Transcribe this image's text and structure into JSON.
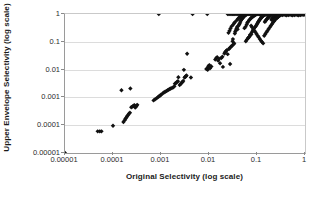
{
  "chart_data": {
    "type": "scatter",
    "title": "",
    "xlabel": "Original Selectivity (log scale)",
    "ylabel": "Upper Envelope Selectivity (log scale)",
    "xscale": "log",
    "yscale": "log",
    "xlim": [
      1e-05,
      1
    ],
    "ylim": [
      1e-05,
      1
    ],
    "xticks": [
      "0.00001",
      "0.0001",
      "0.001",
      "0.01",
      "0.1",
      "1"
    ],
    "yticks": [
      "1",
      "0.1",
      "0.01",
      "0.001",
      "0.0001",
      "0.00001"
    ],
    "xtick_values": [
      1e-05,
      0.0001,
      0.001,
      0.01,
      0.1,
      1
    ],
    "ytick_values": [
      1,
      0.1,
      0.01,
      0.001,
      0.0001,
      1e-05
    ],
    "grid": "horizontal",
    "legend": "none",
    "marker": "filled-diamond",
    "marker_color": "#111111",
    "marker_size": 2.2,
    "points": [
      [
        1e-05,
        1e-05
      ],
      [
        4.8e-05,
        6e-05
      ],
      [
        5.3e-05,
        6e-05
      ],
      [
        5.75e-05,
        6e-05
      ],
      [
        0.0001,
        9.5e-05
      ],
      [
        0.00015,
        0.0018
      ],
      [
        0.00023,
        0.0021
      ],
      [
        0.000165,
        0.00013
      ],
      [
        0.000175,
        0.00015
      ],
      [
        0.000182,
        0.00017
      ],
      [
        0.00019,
        0.00019
      ],
      [
        0.000196,
        0.00021
      ],
      [
        0.000205,
        0.00023
      ],
      [
        0.000215,
        0.00026
      ],
      [
        0.000225,
        0.00028
      ],
      [
        0.00024,
        0.00044
      ],
      [
        0.000255,
        0.00047
      ],
      [
        0.000268,
        0.0005
      ],
      [
        0.00028,
        0.00052
      ],
      [
        0.00029,
        0.00043
      ],
      [
        0.0003,
        0.00046
      ],
      [
        0.00031,
        0.0005
      ],
      [
        0.00032,
        0.00054
      ],
      [
        0.0007,
        0.00078
      ],
      [
        0.00075,
        0.00085
      ],
      [
        0.0008,
        0.00092
      ],
      [
        0.00085,
        0.001
      ],
      [
        0.0009,
        0.00108
      ],
      [
        0.00095,
        0.00115
      ],
      [
        0.001,
        0.00125
      ],
      [
        0.00108,
        0.00138
      ],
      [
        0.00115,
        0.0015
      ],
      [
        0.00122,
        0.0016
      ],
      [
        0.0013,
        0.0017
      ],
      [
        0.00138,
        0.0018
      ],
      [
        0.00145,
        0.0019
      ],
      [
        0.00152,
        0.002
      ],
      [
        0.0016,
        0.0021
      ],
      [
        0.0017,
        0.0022
      ],
      [
        0.0018,
        0.0023
      ],
      [
        0.0019,
        0.0025
      ],
      [
        0.00195,
        0.0031
      ],
      [
        0.00205,
        0.0033
      ],
      [
        0.00215,
        0.0036
      ],
      [
        0.00225,
        0.0038
      ],
      [
        0.0023,
        0.0053
      ],
      [
        0.00245,
        0.0028
      ],
      [
        0.0026,
        0.0031
      ],
      [
        0.0027,
        0.0034
      ],
      [
        0.0028,
        0.0036
      ],
      [
        0.0029,
        0.0039
      ],
      [
        0.003,
        0.0098
      ],
      [
        0.0031,
        0.0052
      ],
      [
        0.0032,
        0.0055
      ],
      [
        0.0033,
        0.0058
      ],
      [
        0.0034,
        0.0061
      ],
      [
        0.0035,
        0.037
      ],
      [
        0.0042,
        0.0052
      ],
      [
        0.00455,
        1
      ],
      [
        0.0009,
        1
      ],
      [
        0.0088,
        0.0105
      ],
      [
        0.0092,
        0.011
      ],
      [
        0.0094,
        0.0098
      ],
      [
        0.0096,
        0.0125
      ],
      [
        0.0098,
        0.0135
      ],
      [
        0.0102,
        0.0145
      ],
      [
        0.0105,
        0.0112
      ],
      [
        0.0112,
        0.013
      ],
      [
        0.0092,
        1
      ],
      [
        0.0135,
        0.023
      ],
      [
        0.0142,
        0.026
      ],
      [
        0.0148,
        0.028
      ],
      [
        0.0155,
        0.021
      ],
      [
        0.0162,
        0.0245
      ],
      [
        0.017,
        0.017
      ],
      [
        0.018,
        0.026
      ],
      [
        0.019,
        0.029
      ],
      [
        0.0195,
        0.0125
      ],
      [
        0.021,
        0.038
      ],
      [
        0.0215,
        0.042
      ],
      [
        0.0225,
        0.046
      ],
      [
        0.0235,
        0.05
      ],
      [
        0.0245,
        0.036
      ],
      [
        0.026,
        0.055
      ],
      [
        0.027,
        0.06
      ],
      [
        0.0275,
        0.016
      ],
      [
        0.029,
        0.068
      ],
      [
        0.0302,
        0.072
      ],
      [
        0.031,
        0.105
      ],
      [
        0.0315,
        0.125
      ],
      [
        0.0325,
        0.082
      ],
      [
        0.0335,
        0.088
      ],
      [
        0.0345,
        0.2
      ],
      [
        0.0352,
        0.23
      ],
      [
        0.0362,
        0.26
      ],
      [
        0.0375,
        0.3
      ],
      [
        0.0385,
        0.34
      ],
      [
        0.0395,
        0.28
      ],
      [
        0.041,
        0.38
      ],
      [
        0.0425,
        0.42
      ],
      [
        0.0435,
        0.46
      ],
      [
        0.0448,
        0.52
      ],
      [
        0.0462,
        0.58
      ],
      [
        0.0475,
        0.63
      ],
      [
        0.049,
        0.68
      ],
      [
        0.0505,
        0.72
      ],
      [
        0.052,
        0.77
      ],
      [
        0.0535,
        0.82
      ],
      [
        0.0548,
        0.31
      ],
      [
        0.0562,
        0.88
      ],
      [
        0.0578,
        0.35
      ],
      [
        0.0595,
        0.93
      ],
      [
        0.061,
        0.42
      ],
      [
        0.0628,
        0.48
      ],
      [
        0.0645,
        0.52
      ],
      [
        0.0662,
        0.14
      ],
      [
        0.068,
        0.58
      ],
      [
        0.07,
        0.63
      ],
      [
        0.0718,
        0.18
      ],
      [
        0.0738,
        0.68
      ],
      [
        0.0758,
        0.73
      ],
      [
        0.0778,
        0.22
      ],
      [
        0.08,
        0.78
      ],
      [
        0.082,
        0.26
      ],
      [
        0.0842,
        0.83
      ],
      [
        0.0865,
        0.3
      ],
      [
        0.089,
        0.88
      ],
      [
        0.0912,
        0.34
      ],
      [
        0.0938,
        0.93
      ],
      [
        0.0962,
        0.38
      ],
      [
        0.099,
        0.42
      ],
      [
        0.102,
        0.46
      ],
      [
        0.1045,
        0.5
      ],
      [
        0.1075,
        0.54
      ],
      [
        0.1105,
        0.58
      ],
      [
        0.1135,
        0.62
      ],
      [
        0.1165,
        0.66
      ],
      [
        0.12,
        0.7
      ],
      [
        0.123,
        0.74
      ],
      [
        0.1265,
        0.78
      ],
      [
        0.13,
        0.82
      ],
      [
        0.134,
        0.86
      ],
      [
        0.1375,
        0.9
      ],
      [
        0.1415,
        0.94
      ],
      [
        0.1455,
        0.52
      ],
      [
        0.15,
        0.56
      ],
      [
        0.154,
        0.6
      ],
      [
        0.1585,
        0.64
      ],
      [
        0.163,
        0.68
      ],
      [
        0.168,
        0.72
      ],
      [
        0.1725,
        0.76
      ],
      [
        0.178,
        0.8
      ],
      [
        0.183,
        0.84
      ],
      [
        0.188,
        0.88
      ],
      [
        0.194,
        0.92
      ],
      [
        0.2,
        0.62
      ],
      [
        0.205,
        0.66
      ],
      [
        0.212,
        0.7
      ],
      [
        0.218,
        0.74
      ],
      [
        0.224,
        0.78
      ],
      [
        0.231,
        0.82
      ],
      [
        0.238,
        0.86
      ],
      [
        0.245,
        0.9
      ],
      [
        0.252,
        0.94
      ],
      [
        0.26,
        0.72
      ],
      [
        0.268,
        0.76
      ],
      [
        0.276,
        0.8
      ],
      [
        0.284,
        0.84
      ],
      [
        0.293,
        0.88
      ],
      [
        0.301,
        0.92
      ],
      [
        0.31,
        0.96
      ],
      [
        0.032,
        0.42
      ],
      [
        0.0335,
        0.47
      ],
      [
        0.035,
        0.52
      ],
      [
        0.0295,
        0.36
      ],
      [
        0.028,
        0.3
      ],
      [
        0.0268,
        0.25
      ],
      [
        0.0255,
        0.21
      ],
      [
        0.038,
        0.6
      ],
      [
        0.04,
        0.66
      ],
      [
        0.0418,
        0.72
      ],
      [
        0.044,
        0.78
      ],
      [
        0.046,
        0.84
      ],
      [
        0.048,
        0.9
      ],
      [
        0.05,
        0.96
      ],
      [
        0.0245,
        1
      ],
      [
        0.026,
        1
      ],
      [
        0.0275,
        1
      ],
      [
        0.029,
        1
      ],
      [
        0.031,
        1
      ],
      [
        0.0328,
        1
      ],
      [
        0.0345,
        1
      ],
      [
        0.0365,
        1
      ],
      [
        0.0385,
        1
      ],
      [
        0.0405,
        1
      ],
      [
        0.0428,
        1
      ],
      [
        0.0452,
        1
      ],
      [
        0.0478,
        1
      ],
      [
        0.0505,
        1
      ],
      [
        0.0532,
        1
      ],
      [
        0.0562,
        1
      ],
      [
        0.0594,
        1
      ],
      [
        0.0628,
        1
      ],
      [
        0.0663,
        1
      ],
      [
        0.07,
        1
      ],
      [
        0.074,
        1
      ],
      [
        0.0782,
        1
      ],
      [
        0.0826,
        1
      ],
      [
        0.0872,
        1
      ],
      [
        0.0922,
        1
      ],
      [
        0.0974,
        1
      ],
      [
        0.103,
        1
      ],
      [
        0.1087,
        1
      ],
      [
        0.1148,
        1
      ],
      [
        0.1213,
        1
      ],
      [
        0.1281,
        1
      ],
      [
        0.1353,
        1
      ],
      [
        0.1429,
        1
      ],
      [
        0.151,
        1
      ],
      [
        0.1595,
        1
      ],
      [
        0.1684,
        1
      ],
      [
        0.1779,
        1
      ],
      [
        0.1879,
        1
      ],
      [
        0.1984,
        1
      ],
      [
        0.2096,
        1
      ],
      [
        0.2213,
        1
      ],
      [
        0.2338,
        1
      ],
      [
        0.2469,
        1
      ],
      [
        0.2608,
        1
      ],
      [
        0.2754,
        1
      ],
      [
        0.2909,
        1
      ],
      [
        0.3072,
        1
      ],
      [
        0.3245,
        1
      ],
      [
        0.3427,
        1
      ],
      [
        0.362,
        1
      ],
      [
        0.3823,
        1
      ],
      [
        0.4038,
        1
      ],
      [
        0.4265,
        1
      ],
      [
        0.4504,
        1
      ],
      [
        0.4757,
        1
      ],
      [
        0.5024,
        1
      ],
      [
        0.5306,
        1
      ],
      [
        0.5604,
        1
      ],
      [
        0.5919,
        1
      ],
      [
        0.6251,
        1
      ],
      [
        0.6602,
        1
      ],
      [
        0.6973,
        1
      ],
      [
        0.7365,
        1
      ],
      [
        0.7779,
        1
      ],
      [
        0.8216,
        1
      ],
      [
        0.8677,
        1
      ],
      [
        0.9165,
        1
      ],
      [
        0.968,
        1
      ],
      [
        0.993,
        1
      ],
      [
        0.115,
        0.96
      ],
      [
        0.122,
        0.93
      ],
      [
        0.129,
        0.9
      ],
      [
        0.137,
        0.95
      ],
      [
        0.145,
        0.91
      ],
      [
        0.153,
        0.97
      ],
      [
        0.162,
        0.93
      ],
      [
        0.172,
        0.89
      ],
      [
        0.182,
        0.95
      ],
      [
        0.193,
        0.91
      ],
      [
        0.204,
        0.97
      ],
      [
        0.216,
        0.93
      ],
      [
        0.229,
        0.89
      ],
      [
        0.243,
        0.95
      ],
      [
        0.257,
        0.91
      ],
      [
        0.272,
        0.97
      ],
      [
        0.288,
        0.93
      ],
      [
        0.305,
        0.89
      ],
      [
        0.323,
        0.95
      ],
      [
        0.342,
        0.91
      ],
      [
        0.363,
        0.97
      ],
      [
        0.384,
        0.93
      ],
      [
        0.407,
        0.89
      ],
      [
        0.431,
        0.95
      ],
      [
        0.457,
        0.91
      ],
      [
        0.484,
        0.97
      ],
      [
        0.512,
        0.93
      ],
      [
        0.543,
        0.89
      ],
      [
        0.575,
        0.95
      ],
      [
        0.609,
        0.91
      ],
      [
        0.645,
        0.97
      ],
      [
        0.683,
        0.93
      ],
      [
        0.724,
        0.89
      ],
      [
        0.767,
        0.95
      ],
      [
        0.812,
        0.91
      ],
      [
        0.86,
        0.97
      ],
      [
        0.911,
        0.93
      ],
      [
        0.965,
        0.96
      ],
      [
        0.0755,
        0.38
      ],
      [
        0.0795,
        0.33
      ],
      [
        0.0838,
        0.29
      ],
      [
        0.0882,
        0.25
      ],
      [
        0.093,
        0.22
      ],
      [
        0.098,
        0.19
      ],
      [
        0.1032,
        0.165
      ],
      [
        0.1088,
        0.145
      ],
      [
        0.1146,
        0.125
      ],
      [
        0.1208,
        0.11
      ],
      [
        0.1273,
        0.098
      ],
      [
        0.1342,
        0.088
      ],
      [
        0.1414,
        0.165
      ],
      [
        0.149,
        0.19
      ],
      [
        0.157,
        0.22
      ],
      [
        0.1655,
        0.25
      ],
      [
        0.1744,
        0.29
      ],
      [
        0.1838,
        0.33
      ],
      [
        0.1937,
        0.38
      ],
      [
        0.2041,
        0.43
      ],
      [
        0.215,
        0.49
      ],
      [
        0.2266,
        0.55
      ],
      [
        0.2388,
        0.62
      ],
      [
        0.2516,
        0.7
      ],
      [
        0.2652,
        0.78
      ],
      [
        0.2795,
        0.86
      ],
      [
        0.0585,
        0.105
      ],
      [
        0.0617,
        0.12
      ],
      [
        0.065,
        0.135
      ],
      [
        0.0685,
        0.15
      ],
      [
        0.0722,
        0.168
      ],
      [
        0.0761,
        0.188
      ]
    ]
  }
}
